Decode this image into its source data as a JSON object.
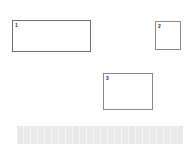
{
  "page": {
    "background_color": "#ffffff",
    "width": 192,
    "height": 144
  },
  "annotations": {
    "box_border_color": "#8a8a8a",
    "label_color": "#2b2b2b",
    "boxes": [
      {
        "id": "box-1",
        "label": "1",
        "x": 12,
        "y": 20,
        "width": 79,
        "height": 32,
        "fill": "#ffffff"
      },
      {
        "id": "box-2",
        "label": "2",
        "x": 155,
        "y": 21,
        "width": 26,
        "height": 29,
        "fill": "#ffffff"
      },
      {
        "id": "box-3",
        "label": "3",
        "x": 103,
        "y": 73,
        "width": 50,
        "height": 37,
        "fill": "#ffffff"
      }
    ]
  },
  "bottom_band": {
    "text": "",
    "fill_color": "#e9e9e9",
    "x": 17,
    "y": 126,
    "width": 166,
    "height": 18
  }
}
